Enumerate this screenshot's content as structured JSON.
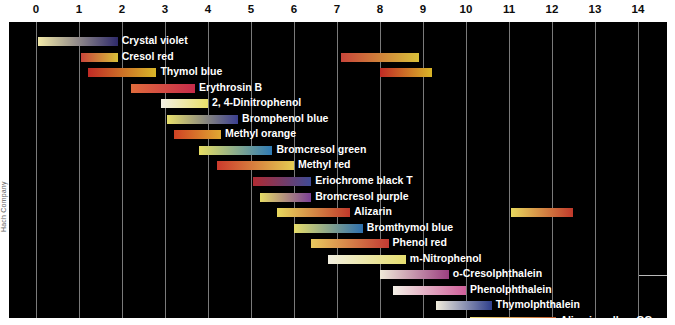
{
  "figure": {
    "credit": "Hach Company",
    "background": "#000000",
    "axis_color": "#8f8f8f",
    "label_color": "#ffffff"
  },
  "chart_data": {
    "type": "bar",
    "orientation": "horizontal-range",
    "title": "",
    "xlabel": "pH",
    "ylabel": "",
    "xlim": [
      0,
      14
    ],
    "xticks": [
      0,
      1,
      2,
      3,
      4,
      5,
      6,
      7,
      8,
      9,
      10,
      11,
      12,
      13,
      14
    ],
    "xtick_labels": [
      "0",
      "1",
      "2",
      "3",
      "4",
      "5",
      "6",
      "7",
      "8",
      "9",
      "10",
      "11",
      "12",
      "13",
      "14"
    ],
    "grid": true,
    "grid_axis": "x",
    "legend": "none",
    "note": "Acid-base indicator pH transition ranges. Each bar spans the pH interval over which the indicator changes colour; bar fill is a left-to-right colour gradient from the acid form colour to the base form colour.",
    "series": [
      {
        "name": "Crystal violet",
        "label": "Crystal violet",
        "label_side": "right",
        "ranges": [
          [
            0.05,
            1.9
          ]
        ],
        "acid_color": "#f2e9a8",
        "base_color": "#2e2a6b"
      },
      {
        "name": "Cresol red",
        "label": "Cresol red",
        "label_side": "right",
        "ranges": [
          [
            1.05,
            1.9
          ],
          [
            7.1,
            8.9
          ]
        ],
        "acid_color": "#c8453a",
        "base_color": "#d8c03a"
      },
      {
        "name": "Thymol blue",
        "label": "Thymol blue",
        "label_side": "right",
        "ranges": [
          [
            1.2,
            2.8
          ],
          [
            8.0,
            9.2
          ]
        ],
        "acid_color": "#c02a25",
        "base_color": "#d9b628"
      },
      {
        "name": "Erythrosin B",
        "label": "Erythrosin B",
        "label_side": "right",
        "ranges": [
          [
            2.2,
            3.7
          ]
        ],
        "acid_color": "#e06b3c",
        "base_color": "#c62b4a"
      },
      {
        "name": "2, 4-Dinitrophenol",
        "label": "2, 4-Dinitrophenol",
        "label_side": "right",
        "ranges": [
          [
            2.9,
            4.0
          ]
        ],
        "acid_color": "#f3f0e4",
        "base_color": "#e8df6a"
      },
      {
        "name": "Bromphenol blue",
        "label": "Bromphenol blue",
        "label_side": "right",
        "ranges": [
          [
            3.05,
            4.7
          ]
        ],
        "acid_color": "#e8e06c",
        "base_color": "#3b3f90"
      },
      {
        "name": "Methyl orange",
        "label": "Methyl orange",
        "label_side": "right",
        "ranges": [
          [
            3.2,
            4.3
          ]
        ],
        "acid_color": "#cf4224",
        "base_color": "#e0a832"
      },
      {
        "name": "Bromcresol green",
        "label": "Bromcresol green",
        "label_side": "right",
        "ranges": [
          [
            3.8,
            5.5
          ]
        ],
        "acid_color": "#e8de63",
        "base_color": "#2f7bb5"
      },
      {
        "name": "Methyl red",
        "label": "Methyl red",
        "label_side": "right",
        "ranges": [
          [
            4.2,
            6.0
          ]
        ],
        "acid_color": "#cc3a2c",
        "base_color": "#e4cc52"
      },
      {
        "name": "Eriochrome black T",
        "label": "Eriochrome black T",
        "label_side": "right",
        "ranges": [
          [
            5.05,
            6.4
          ]
        ],
        "acid_color": "#b02a32",
        "base_color": "#3f4b96"
      },
      {
        "name": "Bromcresol purple",
        "label": "Bromcresol purple",
        "label_side": "right",
        "ranges": [
          [
            5.2,
            6.4
          ]
        ],
        "acid_color": "#e5db66",
        "base_color": "#7b3f96"
      },
      {
        "name": "Alizarin",
        "label": "Alizarin",
        "label_side": "right",
        "ranges": [
          [
            5.6,
            7.3
          ],
          [
            11.05,
            12.5
          ]
        ],
        "acid_color": "#e8d85e",
        "base_color": "#c0392b"
      },
      {
        "name": "Bromthymol blue",
        "label": "Bromthymol blue",
        "label_side": "right",
        "ranges": [
          [
            6.0,
            7.6
          ]
        ],
        "acid_color": "#e6dc6a",
        "base_color": "#2d6fae"
      },
      {
        "name": "Phenol red",
        "label": "Phenol red",
        "label_side": "right",
        "ranges": [
          [
            6.4,
            8.2
          ]
        ],
        "acid_color": "#e8c85e",
        "base_color": "#c33a33"
      },
      {
        "name": "m-Nitrophenol",
        "label": "m-Nitrophenol",
        "label_side": "right",
        "ranges": [
          [
            6.8,
            8.6
          ]
        ],
        "acid_color": "#f2efe0",
        "base_color": "#e6de70"
      },
      {
        "name": "o-Cresolphthalein",
        "label": "o-Cresolphthalein",
        "label_side": "right",
        "ranges": [
          [
            8.0,
            9.6
          ]
        ],
        "acid_color": "#efe9d8",
        "base_color": "#9b3f80"
      },
      {
        "name": "Phenolphthalein",
        "label": "Phenolphthalein",
        "label_side": "right",
        "ranges": [
          [
            8.3,
            10.0
          ]
        ],
        "acid_color": "#f3f0e6",
        "base_color": "#cf5f9a"
      },
      {
        "name": "Thymolphthalein",
        "label": "Thymolphthalein",
        "label_side": "right",
        "ranges": [
          [
            9.3,
            10.6
          ]
        ],
        "acid_color": "#f0ecdc",
        "base_color": "#2f3f8c"
      },
      {
        "name": "Alizarin yellow GG",
        "label": "Alizarin yellow GG",
        "label_side": "right",
        "ranges": [
          [
            10.1,
            12.1
          ]
        ],
        "acid_color": "#f0e07a",
        "base_color": "#c25b2a"
      }
    ]
  }
}
